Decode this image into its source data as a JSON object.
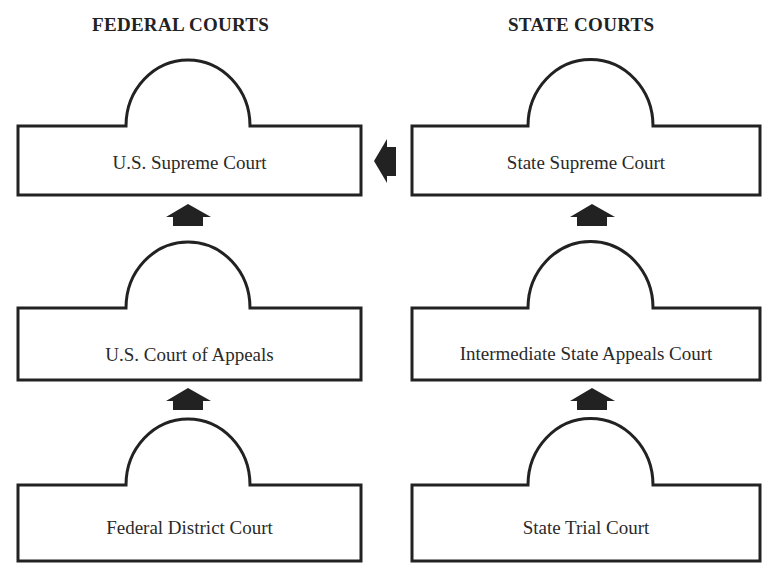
{
  "diagram": {
    "columns": [
      {
        "heading": "FEDERAL COURTS",
        "courts": [
          {
            "name": "U.S. Supreme Court"
          },
          {
            "name": "U.S. Court of Appeals"
          },
          {
            "name": "Federal District Court"
          }
        ]
      },
      {
        "heading": "STATE COURTS",
        "courts": [
          {
            "name": "State Supreme Court"
          },
          {
            "name": "Intermediate State Appeals Court"
          },
          {
            "name": "State Trial Court"
          }
        ]
      }
    ],
    "arrows": [
      {
        "from": "Federal District Court",
        "to": "U.S. Court of Appeals",
        "direction": "up"
      },
      {
        "from": "U.S. Court of Appeals",
        "to": "U.S. Supreme Court",
        "direction": "up"
      },
      {
        "from": "State Trial Court",
        "to": "Intermediate State Appeals Court",
        "direction": "up"
      },
      {
        "from": "Intermediate State Appeals Court",
        "to": "State Supreme Court",
        "direction": "up"
      },
      {
        "from": "State Supreme Court",
        "to": "U.S. Supreme Court",
        "direction": "left"
      }
    ],
    "colors": {
      "line": "#222222",
      "background": "#ffffff"
    }
  }
}
